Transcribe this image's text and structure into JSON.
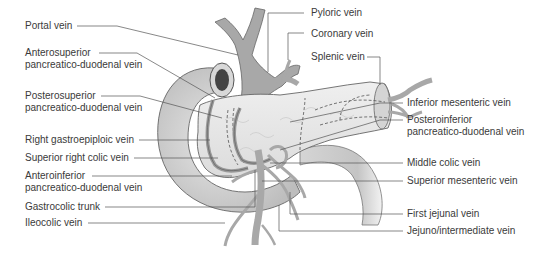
{
  "figure": {
    "colors": {
      "background": "#ffffff",
      "duodenum": "#cfcfcf",
      "pancreas": "#e6e6e6",
      "vein": "#a9a9a9",
      "outline": "#555555",
      "leader_line": "#555555",
      "text": "#3a3a3a"
    }
  },
  "labels_left": [
    {
      "text": "Portal vein"
    },
    {
      "line1": "Anterosuperior",
      "line2": "pancreatico-duodenal vein"
    },
    {
      "line1": "Posterosuperior",
      "line2": "pancreatico-duodenal vein"
    },
    {
      "text": "Right gastroepiploic vein"
    },
    {
      "text": "Superior right colic vein"
    },
    {
      "line1": "Anteroinferior",
      "line2": "pancreatico-duodenal vein"
    },
    {
      "text": "Gastrocolic trunk"
    },
    {
      "text": "Ileocolic vein"
    }
  ],
  "labels_top": [
    {
      "text": "Pyloric vein"
    },
    {
      "text": "Coronary vein"
    },
    {
      "text": "Splenic vein"
    }
  ],
  "labels_right": [
    {
      "text": "Inferior mesenteric vein"
    },
    {
      "line1": "Posteroinferior",
      "line2": "pancreatico-duodenal vein"
    },
    {
      "text": "Middle colic vein"
    },
    {
      "text": "Superior mesenteric vein"
    },
    {
      "text": "First jejunal vein"
    },
    {
      "text": "Jejuno/intermediate vein"
    }
  ]
}
